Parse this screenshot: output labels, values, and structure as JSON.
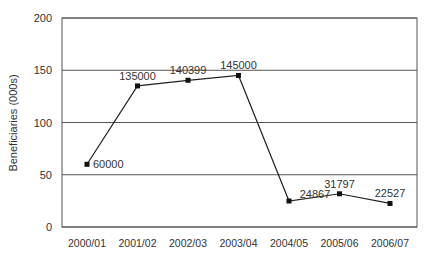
{
  "chart_data": {
    "type": "line",
    "title": "",
    "xlabel": "",
    "ylabel": "Beneficiaries (000s)",
    "ylim": [
      0,
      200
    ],
    "yticks": [
      0,
      50,
      100,
      150,
      200
    ],
    "grid": "horizontal",
    "legend": "none",
    "categories": [
      "2000/01",
      "2001/02",
      "2002/03",
      "2003/04",
      "2004/05",
      "2005/06",
      "2006/07"
    ],
    "series": [
      {
        "name": "Beneficiaries",
        "values": [
          60,
          135,
          140.399,
          145,
          24.867,
          31.797,
          22.527
        ],
        "labels": [
          "60000",
          "135000",
          "140399",
          "145000",
          "24867",
          "31797",
          "22527"
        ]
      }
    ]
  },
  "colors": {
    "line": "#222222",
    "marker": "#111111",
    "grid": "#555555",
    "text": "#333333"
  }
}
